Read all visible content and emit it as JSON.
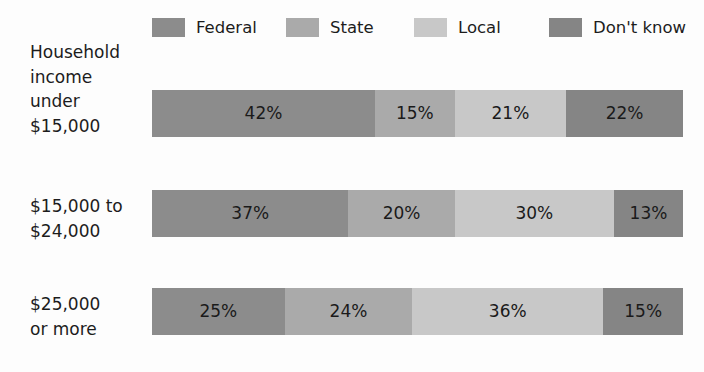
{
  "chart_data": {
    "type": "bar",
    "subtype": "stacked-horizontal-100-percent",
    "title": "",
    "xlabel": "",
    "ylabel": "",
    "grid": false,
    "legend_position": "top",
    "xlim": [
      0,
      100
    ],
    "unit": "%",
    "categories": [
      "Household income under $15,000",
      "$15,000 to $24,000",
      "$25,000 or more"
    ],
    "series": [
      {
        "name": "Federal",
        "color": "#8c8c8c",
        "values": [
          42,
          37,
          25
        ]
      },
      {
        "name": "State",
        "color": "#aaaaaa",
        "values": [
          15,
          20,
          24
        ]
      },
      {
        "name": "Local",
        "color": "#c8c8c8",
        "values": [
          21,
          30,
          36
        ]
      },
      {
        "name": "Don't know",
        "color": "#858585",
        "values": [
          22,
          13,
          15
        ]
      }
    ]
  },
  "legend": {
    "items": [
      {
        "label": "Federal",
        "color": "#8c8c8c"
      },
      {
        "label": "State",
        "color": "#aaaaaa"
      },
      {
        "label": "Local",
        "color": "#c8c8c8"
      },
      {
        "label": "Don't know",
        "color": "#858585"
      }
    ]
  },
  "rows": [
    {
      "label": "Household\nincome\nunder\n$15,000",
      "segments": [
        {
          "series": "Federal",
          "value": 42,
          "value_label": "42%",
          "color": "#8c8c8c"
        },
        {
          "series": "State",
          "value": 15,
          "value_label": "15%",
          "color": "#aaaaaa"
        },
        {
          "series": "Local",
          "value": 21,
          "value_label": "21%",
          "color": "#c8c8c8"
        },
        {
          "series": "Don't know",
          "value": 22,
          "value_label": "22%",
          "color": "#858585"
        }
      ]
    },
    {
      "label": "$15,000 to\n$24,000",
      "segments": [
        {
          "series": "Federal",
          "value": 37,
          "value_label": "37%",
          "color": "#8c8c8c"
        },
        {
          "series": "State",
          "value": 20,
          "value_label": "20%",
          "color": "#aaaaaa"
        },
        {
          "series": "Local",
          "value": 30,
          "value_label": "30%",
          "color": "#c8c8c8"
        },
        {
          "series": "Don't know",
          "value": 13,
          "value_label": "13%",
          "color": "#858585"
        }
      ]
    },
    {
      "label": "$25,000\nor more",
      "segments": [
        {
          "series": "Federal",
          "value": 25,
          "value_label": "25%",
          "color": "#8c8c8c"
        },
        {
          "series": "State",
          "value": 24,
          "value_label": "24%",
          "color": "#aaaaaa"
        },
        {
          "series": "Local",
          "value": 36,
          "value_label": "36%",
          "color": "#c8c8c8"
        },
        {
          "series": "Don't know",
          "value": 15,
          "value_label": "15%",
          "color": "#858585"
        }
      ]
    }
  ],
  "colors": {
    "background": "#fdfdfd",
    "text": "#1c1c1c",
    "federal": "#8c8c8c",
    "state": "#aaaaaa",
    "local": "#c8c8c8",
    "dont_know": "#858585"
  }
}
